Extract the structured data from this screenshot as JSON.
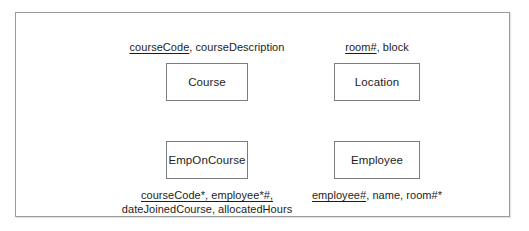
{
  "diagram": {
    "type": "entity-relationship-attribute-listing",
    "entities": [
      {
        "id": "course",
        "name": "Course",
        "attributes": {
          "lines": [
            {
              "text": "courseCode, courseDescription",
              "underlined_prefix": "courseCode",
              "rest": ", courseDescription"
            }
          ]
        },
        "position": "top-left"
      },
      {
        "id": "location",
        "name": "Location",
        "attributes": {
          "lines": [
            {
              "text": "room#, block",
              "underlined_prefix": "room#",
              "rest": ", block"
            }
          ]
        },
        "position": "top-right"
      },
      {
        "id": "emponcourse",
        "name": "EmpOnCourse",
        "attributes": {
          "lines": [
            {
              "text": "courseCode*, employee*#,",
              "underlined_prefix": "courseCode*, employee*#,",
              "rest": ""
            },
            {
              "text": "dateJoinedCourse, allocatedHours",
              "underlined_prefix": "",
              "rest": "dateJoinedCourse, allocatedHours"
            }
          ]
        },
        "position": "bottom-left"
      },
      {
        "id": "employee",
        "name": "Employee",
        "attributes": {
          "lines": [
            {
              "text": "employee#, name, room#*",
              "underlined_prefix": "employee#",
              "rest": ", name, room#*"
            }
          ]
        },
        "position": "bottom-right"
      }
    ],
    "colors": {
      "frame_border": "#9a9a9a",
      "box_border": "#7d7d7d",
      "text": "#1d1d1d",
      "background": "#ffffff"
    }
  }
}
